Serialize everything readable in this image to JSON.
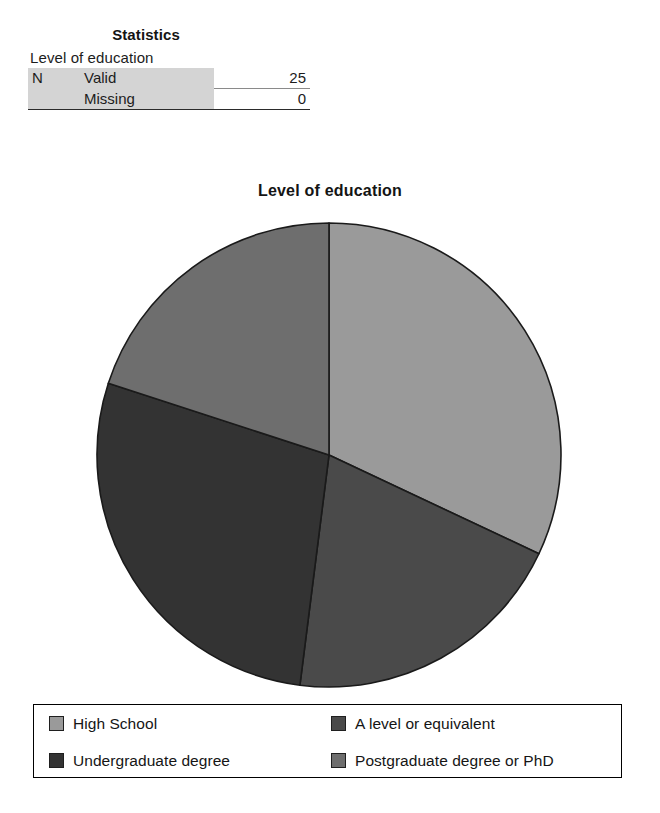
{
  "statistics_table": {
    "title": "Statistics",
    "caption": "Level of education",
    "rows": [
      {
        "group": "N",
        "label": "Valid",
        "value": "25"
      },
      {
        "group": "",
        "label": "Missing",
        "value": "0"
      }
    ]
  },
  "chart_data": {
    "type": "pie",
    "title": "Level of education",
    "categories": [
      "High School",
      "A level or equivalent",
      "Undergraduate degree",
      "Postgraduate degree or PhD"
    ],
    "values": [
      8,
      5,
      7,
      5
    ],
    "total": 25,
    "units": "respondents",
    "start_angle_deg": 0,
    "direction": "clockwise",
    "slice_angles_deg": [
      115.2,
      72.0,
      100.8,
      72.0
    ],
    "slice_percents": [
      32.0,
      20.0,
      28.0,
      20.0
    ],
    "colors": [
      "#9a9a9a",
      "#4a4a4a",
      "#333333",
      "#6e6e6e"
    ],
    "slice_border_color": "#1a1a1a",
    "legend_position": "bottom",
    "legend_columns": 2,
    "grid": false,
    "xlabel": "",
    "ylabel": ""
  },
  "legend": {
    "entries": [
      {
        "label": "High School",
        "color": "#9a9a9a"
      },
      {
        "label": "A level or equivalent",
        "color": "#4a4a4a"
      },
      {
        "label": "Undergraduate degree",
        "color": "#333333"
      },
      {
        "label": "Postgraduate degree or PhD",
        "color": "#6e6e6e"
      }
    ]
  }
}
